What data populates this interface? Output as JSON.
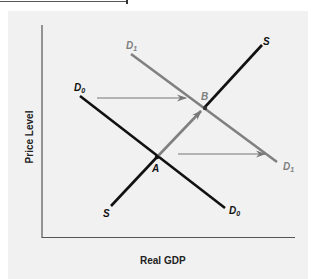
{
  "diagram": {
    "type": "aggregate-demand-shift",
    "axes": {
      "x_label": "Real GDP",
      "y_label": "Price Level"
    },
    "curves": [
      {
        "id": "D0",
        "label": "D",
        "subscript": "0",
        "kind": "demand",
        "color": "#111111",
        "from": [
          80,
          96
        ],
        "to": [
          225,
          208
        ]
      },
      {
        "id": "D1",
        "label": "D",
        "subscript": "1",
        "kind": "demand",
        "color": "#808080",
        "from": [
          131,
          54
        ],
        "to": [
          277,
          162
        ]
      },
      {
        "id": "S",
        "label": "S",
        "kind": "supply",
        "color": "#111111",
        "from": [
          111,
          206
        ],
        "to": [
          262,
          45
        ]
      }
    ],
    "points": [
      {
        "id": "A",
        "label": "A",
        "description": "initial equilibrium (D0 and S)"
      },
      {
        "id": "B",
        "label": "B",
        "description": "new equilibrium (D1 and S)"
      }
    ],
    "arrows": [
      {
        "description": "shift of demand right at upper level",
        "from": "D0",
        "to": "D1"
      },
      {
        "description": "shift of demand right at lower level",
        "from": "D0",
        "to": "D1"
      },
      {
        "description": "movement along supply from A to B",
        "from": "A",
        "to": "B"
      }
    ],
    "labels": {
      "d0_top": "D",
      "d0_top_sub": "0",
      "d0_bottom": "D",
      "d0_bottom_sub": "0",
      "d1_top": "D",
      "d1_top_sub": "1",
      "d1_bottom": "D",
      "d1_bottom_sub": "1",
      "s_top": "S",
      "s_bottom": "S",
      "point_a": "A",
      "point_b": "B"
    },
    "colors": {
      "background": "#f1f1f1",
      "axis": "#555555",
      "curve_dark": "#111111",
      "curve_shift": "#808080",
      "arrow": "#777777"
    }
  }
}
